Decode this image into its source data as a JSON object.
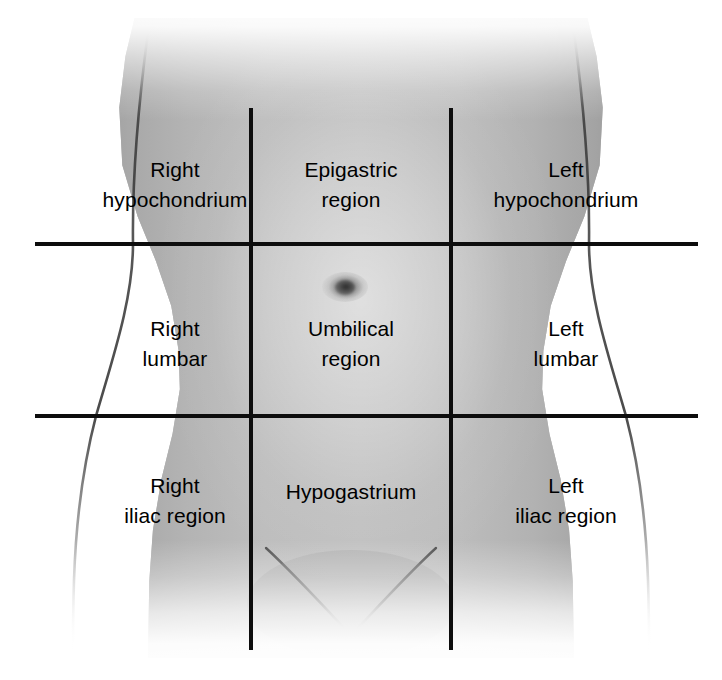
{
  "figure": {
    "view": "anterior abdominal wall, front view",
    "background_color": "#ffffff",
    "line_color": "#0d0d0d",
    "text_color": "#000000"
  },
  "grid": {
    "vertical_lines": [
      {
        "name": "right-midclavicular-line",
        "x": 251,
        "y_top": 108,
        "y_bottom": 650
      },
      {
        "name": "left-midclavicular-line",
        "x": 451,
        "y_top": 108,
        "y_bottom": 650
      }
    ],
    "horizontal_lines": [
      {
        "name": "subcostal-plane",
        "y": 244,
        "x_left": 35,
        "x_right": 698
      },
      {
        "name": "intertubercular-plane",
        "y": 416,
        "x_left": 35,
        "x_right": 698
      }
    ]
  },
  "regions": [
    {
      "id": "right-hypochondrium",
      "label": "Right\nhypochondrium",
      "row": "upper",
      "column": "right",
      "cx": 175,
      "cy": 185
    },
    {
      "id": "epigastric-region",
      "label": "Epigastric\nregion",
      "row": "upper",
      "column": "center",
      "cx": 351,
      "cy": 185
    },
    {
      "id": "left-hypochondrium",
      "label": "Left\nhypochondrium",
      "row": "upper",
      "column": "left",
      "cx": 566,
      "cy": 185
    },
    {
      "id": "right-lumbar",
      "label": "Right\nlumbar",
      "row": "middle",
      "column": "right",
      "cx": 175,
      "cy": 344
    },
    {
      "id": "umbilical-region",
      "label": "Umbilical\nregion",
      "row": "middle",
      "column": "center",
      "cx": 351,
      "cy": 344
    },
    {
      "id": "left-lumbar",
      "label": "Left\nlumbar",
      "row": "middle",
      "column": "left",
      "cx": 566,
      "cy": 344
    },
    {
      "id": "right-iliac-region",
      "label": "Right\niliac region",
      "row": "lower",
      "column": "right",
      "cx": 175,
      "cy": 501
    },
    {
      "id": "hypogastrium",
      "label": "Hypogastrium",
      "row": "lower",
      "column": "center",
      "cx": 351,
      "cy": 492
    },
    {
      "id": "left-iliac-region",
      "label": "Left\niliac region",
      "row": "lower",
      "column": "left",
      "cx": 566,
      "cy": 501
    }
  ],
  "anatomy_marks": [
    {
      "id": "umbilicus",
      "name": "navel",
      "cx": 345,
      "cy": 287
    },
    {
      "id": "right-inguinal-crease",
      "name": "right groin crease"
    },
    {
      "id": "left-inguinal-crease",
      "name": "left groin crease"
    }
  ]
}
